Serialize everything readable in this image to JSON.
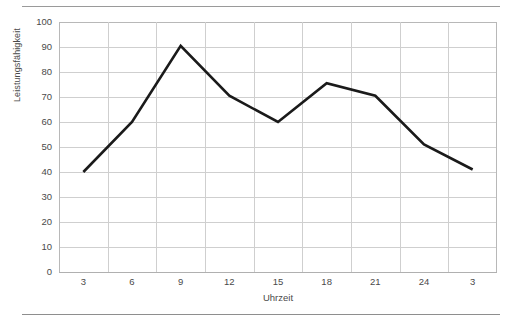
{
  "figure": {
    "background": "#ffffff",
    "rule_color": "#9a9a9a",
    "has_top_rule": true,
    "has_bottom_rule": true
  },
  "chart_data": {
    "type": "line",
    "title": "",
    "subtitle": "",
    "xlabel": "Uhrzeit",
    "ylabel": "Leistungsfähigkeit",
    "categories": [
      "3",
      "6",
      "9",
      "12",
      "15",
      "18",
      "21",
      "24",
      "3"
    ],
    "values": [
      40,
      60,
      90.5,
      70.5,
      60,
      75.5,
      70.5,
      51,
      41
    ],
    "series": [
      {
        "name": "Leistungsfähigkeit",
        "color": "#1a1a1a",
        "line_width": 2.6,
        "markers": false,
        "values": [
          40,
          60,
          90.5,
          70.5,
          60,
          75.5,
          70.5,
          51,
          41
        ]
      }
    ],
    "ylim": [
      0,
      100
    ],
    "y_ticks": [
      0,
      10,
      20,
      30,
      40,
      50,
      60,
      70,
      80,
      90,
      100
    ],
    "y_tick_labels": [
      "0",
      "10",
      "20",
      "30",
      "40",
      "50",
      "60",
      "70",
      "80",
      "90",
      "100"
    ],
    "x_tick_labels": [
      "3",
      "6",
      "9",
      "12",
      "15",
      "18",
      "21",
      "24",
      "3"
    ],
    "grid": {
      "horizontal": true,
      "vertical": true,
      "color": "#cfcfcf"
    },
    "legend": {
      "visible": false,
      "position": "none",
      "entries": []
    },
    "annotations": []
  }
}
